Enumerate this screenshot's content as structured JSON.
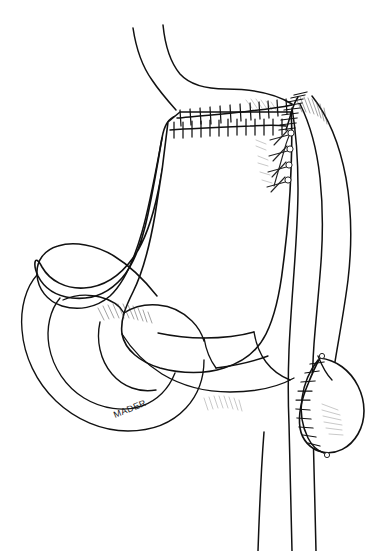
{
  "figure": {
    "title": "Roux-en-Y esophagojejunostomy after total gastrectomy",
    "medium": "black-and-white line drawing, pen and ink",
    "background_color": "#ffffff",
    "line_color": "#111111",
    "width": 371,
    "height": 551,
    "artist_signature": "MADER"
  },
  "anatomy": {
    "structures": [
      {
        "id": "esophagus",
        "label": "Esophagus",
        "description": "Two descending curved lines entering from top center"
      },
      {
        "id": "gastric-pouch",
        "label": "Gastric pouch / stomach remnant",
        "description": "Large central organ body with greater curvature on the left"
      },
      {
        "id": "jejunal-loop",
        "label": "Jejunal loop",
        "description": "Looped bowel segment at left and lower left"
      },
      {
        "id": "roux-limb",
        "label": "Roux limb",
        "description": "Vertical bowel limb descending on the right side to the bottom edge"
      },
      {
        "id": "blind-pouch",
        "label": "Blind end / closed stump",
        "description": "Rounded sutured pouch at lower right"
      },
      {
        "id": "mesentery",
        "label": "Mesentery",
        "description": "Hatch-shaded membrane between bowel segments"
      }
    ]
  },
  "surgical_features": {
    "suture_lines": [
      {
        "id": "upper-staple-line",
        "label": "Upper transverse staple line",
        "type": "staple",
        "stitch_count": 12,
        "orientation": "horizontal"
      },
      {
        "id": "lower-staple-line",
        "label": "Lower transverse staple line",
        "type": "staple",
        "stitch_count": 13,
        "orientation": "horizontal"
      },
      {
        "id": "right-oblique-staple-line",
        "label": "Oblique staple line along anastomosis",
        "type": "staple",
        "stitch_count": 9,
        "orientation": "oblique"
      },
      {
        "id": "interrupted-sutures",
        "label": "Interrupted sutures with knots",
        "type": "interrupted-suture",
        "stitch_count": 4,
        "orientation": "oblique"
      },
      {
        "id": "pouch-suture-line",
        "label": "Blind pouch closure suture line",
        "type": "running-suture",
        "stitch_count": 11,
        "orientation": "curved"
      }
    ],
    "shading_regions": [
      {
        "id": "mesentery-hatch-left",
        "label": "Mesenteric hatching, left"
      },
      {
        "id": "mesentery-hatch-lower",
        "label": "Mesenteric hatching, lower center"
      },
      {
        "id": "anastomosis-hatch",
        "label": "Hatching at anastomosis"
      },
      {
        "id": "pouch-hatch",
        "label": "Hatching on blind pouch"
      }
    ]
  },
  "signature": {
    "text": "MADER",
    "position": "lower-left-center"
  }
}
